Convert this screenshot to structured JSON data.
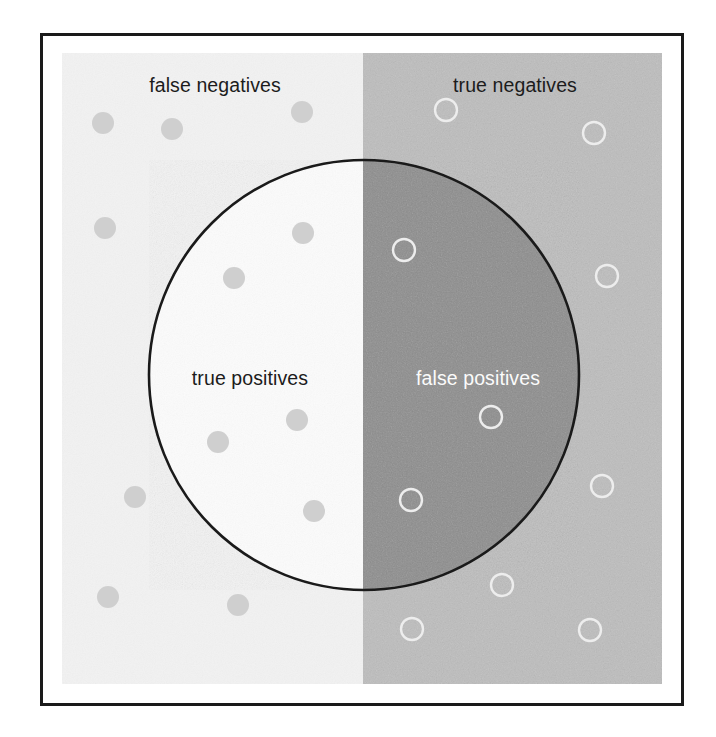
{
  "figure": {
    "width": 716,
    "height": 737,
    "frame": {
      "x": 40,
      "y": 33,
      "width": 644,
      "height": 673,
      "border_color": "#1a1a1a",
      "border_width": 3,
      "fill": "#ffffff"
    }
  },
  "labels": {
    "false_negatives": "false negatives",
    "true_negatives": "true negatives",
    "true_positives": "true positives",
    "false_positives": "false positives"
  },
  "colors": {
    "page_background": "#ffffff",
    "frame_border": "#1a1a1a",
    "left_region": "#f2f2f2",
    "right_region": "#bdbdbd",
    "circle_left": "#fbfbfb",
    "circle_right": "#8d8d8d",
    "circle_outline": "#1a1a1a",
    "positive_dot": "#cfcfcf",
    "negative_ring": "#ededed",
    "label_dark": "#1c1c1c",
    "label_light": "#fbfbfb"
  },
  "chart_data": {
    "type": "diagram",
    "subtype": "venn-confusion-matrix",
    "quadrants": [
      {
        "key": "false_negatives",
        "label": "false negatives",
        "inside_circle": false,
        "side": "left",
        "background": "#f2f2f2",
        "text_color": "#1c1c1c",
        "label_x": 215,
        "label_y": 85
      },
      {
        "key": "true_negatives",
        "label": "true negatives",
        "inside_circle": false,
        "side": "right",
        "background": "#bdbdbd",
        "text_color": "#1c1c1c",
        "label_x": 515,
        "label_y": 85
      },
      {
        "key": "true_positives",
        "label": "true positives",
        "inside_circle": true,
        "side": "left",
        "background": "#fbfbfb",
        "text_color": "#1c1c1c",
        "label_x": 250,
        "label_y": 378
      },
      {
        "key": "false_positives",
        "label": "false positives",
        "inside_circle": true,
        "side": "right",
        "background": "#8d8d8d",
        "text_color": "#fbfbfb",
        "label_x": 478,
        "label_y": 378
      }
    ],
    "regions": {
      "left_panel": {
        "x": 62,
        "y": 53,
        "width": 301,
        "height": 631,
        "fill": "#f2f2f2"
      },
      "right_panel": {
        "x": 363,
        "y": 53,
        "width": 299,
        "height": 631,
        "fill": "#bdbdbd"
      },
      "divider_x": 363
    },
    "circle": {
      "cx": 364,
      "cy": 375,
      "r": 215,
      "stroke": "#1a1a1a",
      "stroke_width": 2.6
    },
    "markers": {
      "positive_dot": {
        "shape": "filled-circle",
        "fill": "#cfcfcf",
        "radius": 11,
        "meaning": "actual positive case"
      },
      "negative_ring": {
        "shape": "hollow-circle",
        "stroke": "#ededed",
        "radius": 11,
        "stroke_width": 2.4,
        "meaning": "actual negative case"
      }
    },
    "points": [
      {
        "x": 103,
        "y": 123,
        "marker": "positive_dot",
        "region": "false_negatives"
      },
      {
        "x": 172,
        "y": 129,
        "marker": "positive_dot",
        "region": "false_negatives"
      },
      {
        "x": 302,
        "y": 112,
        "marker": "positive_dot",
        "region": "false_negatives"
      },
      {
        "x": 105,
        "y": 228,
        "marker": "positive_dot",
        "region": "false_negatives"
      },
      {
        "x": 135,
        "y": 497,
        "marker": "positive_dot",
        "region": "false_negatives"
      },
      {
        "x": 108,
        "y": 597,
        "marker": "positive_dot",
        "region": "false_negatives"
      },
      {
        "x": 238,
        "y": 605,
        "marker": "positive_dot",
        "region": "false_negatives"
      },
      {
        "x": 303,
        "y": 233,
        "marker": "positive_dot",
        "region": "true_positives"
      },
      {
        "x": 234,
        "y": 278,
        "marker": "positive_dot",
        "region": "true_positives"
      },
      {
        "x": 297,
        "y": 420,
        "marker": "positive_dot",
        "region": "true_positives"
      },
      {
        "x": 218,
        "y": 442,
        "marker": "positive_dot",
        "region": "true_positives"
      },
      {
        "x": 314,
        "y": 511,
        "marker": "positive_dot",
        "region": "true_positives"
      },
      {
        "x": 446,
        "y": 110,
        "marker": "negative_ring",
        "region": "true_negatives"
      },
      {
        "x": 594,
        "y": 133,
        "marker": "negative_ring",
        "region": "true_negatives"
      },
      {
        "x": 607,
        "y": 276,
        "marker": "negative_ring",
        "region": "true_negatives"
      },
      {
        "x": 602,
        "y": 486,
        "marker": "negative_ring",
        "region": "true_negatives"
      },
      {
        "x": 502,
        "y": 585,
        "marker": "negative_ring",
        "region": "true_negatives"
      },
      {
        "x": 412,
        "y": 629,
        "marker": "negative_ring",
        "region": "true_negatives"
      },
      {
        "x": 590,
        "y": 630,
        "marker": "negative_ring",
        "region": "true_negatives"
      },
      {
        "x": 404,
        "y": 250,
        "marker": "negative_ring",
        "region": "false_positives"
      },
      {
        "x": 491,
        "y": 417,
        "marker": "negative_ring",
        "region": "false_positives"
      },
      {
        "x": 411,
        "y": 500,
        "marker": "negative_ring",
        "region": "false_positives"
      }
    ],
    "counts": {
      "true_positives": 5,
      "false_negatives": 7,
      "false_positives": 3,
      "true_negatives": 7
    }
  }
}
